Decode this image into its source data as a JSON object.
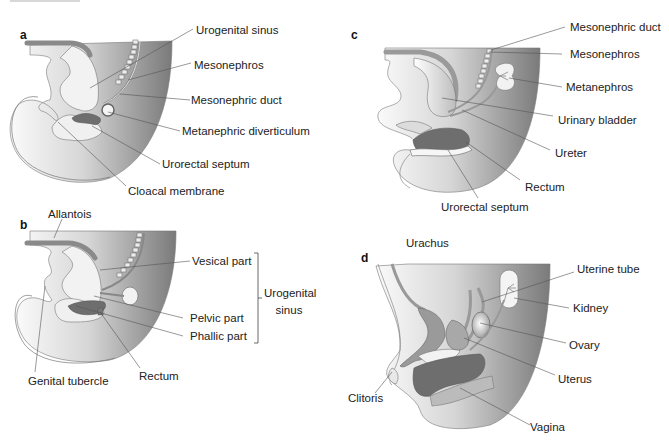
{
  "figure": {
    "panels": [
      {
        "id": "a",
        "letter": "a",
        "labels": {
          "urogenital_sinus": "Urogenital sinus",
          "mesonephros": "Mesonephros",
          "mesonephric_duct": "Mesonephric duct",
          "metanephric_diverticulum": "Metanephric diverticulum",
          "urorectal_septum": "Urorectal septum",
          "cloacal_membrane": "Cloacal membrane"
        }
      },
      {
        "id": "b",
        "letter": "b",
        "labels": {
          "allantois": "Allantois",
          "vesical_part": "Vesical part",
          "pelvic_part": "Pelvic part",
          "phallic_part": "Phallic part",
          "genital_tubercle": "Genital tubercle",
          "rectum": "Rectum",
          "bracket_group_line1": "Urogenital",
          "bracket_group_line2": "sinus"
        }
      },
      {
        "id": "c",
        "letter": "c",
        "labels": {
          "mesonephric_duct": "Mesonephric duct",
          "mesonephros": "Mesonephros",
          "metanephros": "Metanephros",
          "urinary_bladder": "Urinary bladder",
          "ureter": "Ureter",
          "rectum": "Rectum",
          "urorectal_septum": "Urorectal septum"
        }
      },
      {
        "id": "d",
        "letter": "d",
        "labels": {
          "urachus": "Urachus",
          "uterine_tube": "Uterine tube",
          "kidney": "Kidney",
          "ovary": "Ovary",
          "uterus": "Uterus",
          "clitoris": "Clitoris",
          "vagina": "Vagina"
        }
      }
    ],
    "colors": {
      "tissue_light": "#f4f4f4",
      "tissue_dark": "#7a7a7a",
      "organ_dark": "#6e6e6e",
      "organ_mid": "#9a9a9a",
      "leader_line": "#555555",
      "outline": "#666666"
    }
  }
}
